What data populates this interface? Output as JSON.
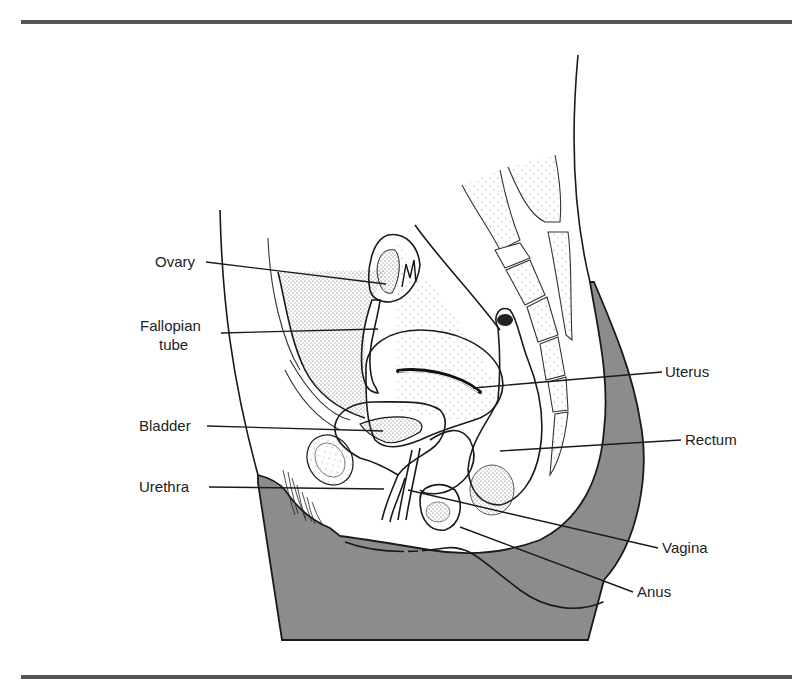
{
  "figure": {
    "type": "anatomical cross-section diagram",
    "colors": {
      "rule": "#555555",
      "body_fill": "#8c8c8c",
      "line": "#1a1a1a",
      "stipple": "#555555",
      "background": "#ffffff"
    }
  },
  "labels": {
    "left": [
      {
        "id": "ovary",
        "text": "Ovary"
      },
      {
        "id": "fallopian_tube",
        "lines": [
          "Fallopian",
          "tube"
        ]
      },
      {
        "id": "bladder",
        "text": "Bladder"
      },
      {
        "id": "urethra",
        "text": "Urethra"
      }
    ],
    "right": [
      {
        "id": "uterus",
        "text": "Uterus"
      },
      {
        "id": "rectum",
        "text": "Rectum"
      },
      {
        "id": "vagina",
        "text": "Vagina"
      },
      {
        "id": "anus",
        "text": "Anus"
      }
    ]
  }
}
